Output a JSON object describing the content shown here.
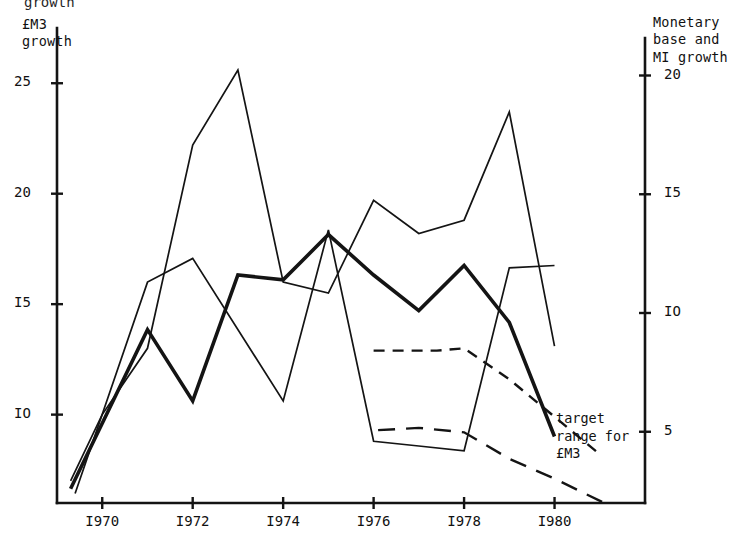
{
  "figure": {
    "clipped_top_title": "growth",
    "left_axis_title": "£M3\ngrowth",
    "right_axis_title": "Monetary\nbase and\nMI growth",
    "annotation": "target\nrange for\n£M3",
    "ink_color": "#141414",
    "background_color": "#ffffff"
  },
  "chart_data": {
    "type": "line",
    "xlabel": "",
    "ylabel": "£M3 growth",
    "y2label": "Monetary base and MI growth",
    "grid": false,
    "legend": "none",
    "xlim": [
      1969,
      1982
    ],
    "ylim": [
      6.0,
      27.5
    ],
    "y2lim": [
      2.0,
      22.0
    ],
    "x_ticks": [
      "I970",
      "I972",
      "I974",
      "I976",
      "I978",
      "I980"
    ],
    "x_tick_values": [
      1970,
      1972,
      1974,
      1976,
      1978,
      1980
    ],
    "y_ticks_left": [
      "25",
      "20",
      "I5",
      "IO"
    ],
    "y_tick_values_left": [
      25,
      20,
      15,
      10
    ],
    "y_ticks_right": [
      "20",
      "I5",
      "IO",
      "5"
    ],
    "y_tick_values_right": [
      20,
      15,
      10,
      5
    ],
    "series": [
      {
        "name": "£M3 growth",
        "axis": "left",
        "style": "solid-thin",
        "x": [
          1969.3,
          1970.0,
          1971.0,
          1972.0,
          1973.0,
          1974.0,
          1975.0,
          1976.0,
          1977.0,
          1978.0,
          1979.0,
          1980.0
        ],
        "values": [
          7.0,
          10.0,
          13.0,
          22.2,
          25.6,
          16.0,
          15.5,
          19.7,
          18.2,
          18.8,
          23.7,
          13.1
        ]
      },
      {
        "name": "Monetary base growth",
        "axis": "right",
        "style": "solid-thick",
        "x": [
          1969.3,
          1971.0,
          1972.0,
          1973.0,
          1974.0,
          1975.0,
          1976.0,
          1977.0,
          1978.0,
          1979.0,
          1980.0
        ],
        "values": [
          2.6,
          9.3,
          6.3,
          11.6,
          11.4,
          13.3,
          11.6,
          10.1,
          12.0,
          9.6,
          4.8
        ]
      },
      {
        "name": "MI growth",
        "axis": "right",
        "style": "solid-thin",
        "x": [
          1969.4,
          1971.0,
          1972.0,
          1974.0,
          1975.0,
          1976.0,
          1977.0,
          1978.0,
          1979.0,
          1980.0
        ],
        "values": [
          2.4,
          11.3,
          12.3,
          6.3,
          13.5,
          4.6,
          4.4,
          4.2,
          11.9,
          12.0
        ]
      },
      {
        "name": "target range for £M3 (upper)",
        "axis": "left",
        "style": "dashed",
        "x": [
          1976.0,
          1977.4,
          1978.0,
          1979.0,
          1980.0,
          1981.0
        ],
        "values": [
          12.9,
          12.9,
          13.0,
          11.6,
          9.9,
          8.2
        ]
      },
      {
        "name": "target range for £M3 (lower)",
        "axis": "left",
        "style": "dashed-long",
        "x": [
          1976.1,
          1977.0,
          1978.0,
          1979.0,
          1980.0,
          1981.1
        ],
        "values": [
          9.3,
          9.4,
          9.2,
          8.0,
          7.1,
          6.0
        ]
      }
    ],
    "annotations": [
      {
        "text": "target range for £M3",
        "x": 1980.4,
        "y": 7.6
      }
    ]
  }
}
